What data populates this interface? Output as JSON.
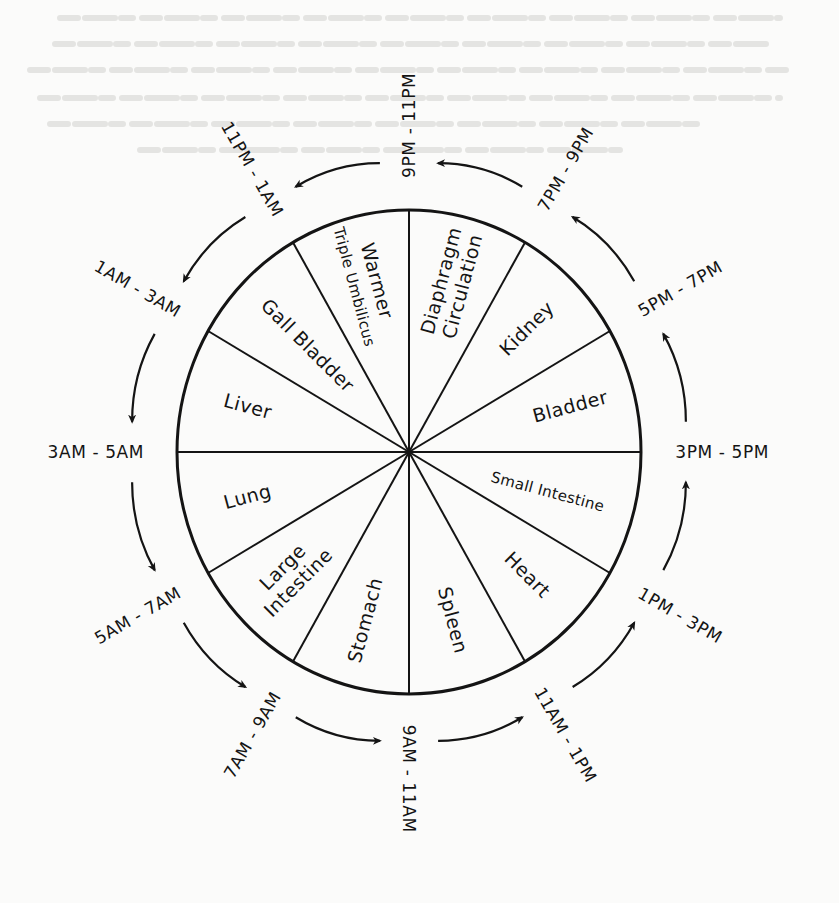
{
  "diagram": {
    "type": "circular-wheel",
    "segments": [
      {
        "organ": "Bladder",
        "lines": [
          "Bladder"
        ],
        "time": "3PM - 5PM",
        "start_deg": 0,
        "end_deg": 30
      },
      {
        "organ": "Kidney",
        "lines": [
          "Kidney"
        ],
        "time": "5PM - 7PM",
        "start_deg": 30,
        "end_deg": 60
      },
      {
        "organ": "Diaphragm Circulation",
        "lines": [
          "Diaphragm",
          "Circulation"
        ],
        "time": "7PM - 9PM",
        "start_deg": 60,
        "end_deg": 90
      },
      {
        "organ": "Triple Warmer Umbilicus",
        "lines": [
          "Warmer",
          "Triple Umbilicus"
        ],
        "time": "9PM - 11PM",
        "start_deg": 90,
        "end_deg": 120
      },
      {
        "organ": "Gall Bladder",
        "lines": [
          "Gall Bladder"
        ],
        "time": "11PM - 1AM",
        "start_deg": 120,
        "end_deg": 150
      },
      {
        "organ": "Liver",
        "lines": [
          "Liver"
        ],
        "time": "1AM - 3AM",
        "start_deg": 150,
        "end_deg": 180
      },
      {
        "organ": "Lung",
        "lines": [
          "Lung"
        ],
        "time": "3AM - 5AM",
        "start_deg": 180,
        "end_deg": 210
      },
      {
        "organ": "Large Intestine",
        "lines": [
          "Large",
          "Intestine"
        ],
        "time": "5AM - 7AM",
        "start_deg": 210,
        "end_deg": 240
      },
      {
        "organ": "Stomach",
        "lines": [
          "Stomach"
        ],
        "time": "7AM - 9AM",
        "start_deg": 240,
        "end_deg": 270
      },
      {
        "organ": "Spleen",
        "lines": [
          "Spleen"
        ],
        "time": "9AM - 11AM",
        "start_deg": 270,
        "end_deg": 300
      },
      {
        "organ": "Heart",
        "lines": [
          "Heart"
        ],
        "time": "11AM - 1PM",
        "start_deg": 300,
        "end_deg": 330
      },
      {
        "organ": "Small Intestine",
        "lines": [
          "Small Intestine"
        ],
        "time": "1PM - 3PM",
        "start_deg": 330,
        "end_deg": 360
      }
    ],
    "time_labels": [
      {
        "text": "9PM - 11PM",
        "spoke_deg": 90
      },
      {
        "text": "11PM - 1AM",
        "spoke_deg": 120
      },
      {
        "text": "1AM - 3AM",
        "spoke_deg": 150
      },
      {
        "text": "3AM - 5AM",
        "spoke_deg": 180
      },
      {
        "text": "5AM - 7AM",
        "spoke_deg": 210
      },
      {
        "text": "7AM - 9AM",
        "spoke_deg": 240
      },
      {
        "text": "9AM - 11AM",
        "spoke_deg": 270
      },
      {
        "text": "11AM - 1PM",
        "spoke_deg": 300
      },
      {
        "text": "1PM - 3PM",
        "spoke_deg": 330
      },
      {
        "text": "3PM - 5PM",
        "spoke_deg": 0
      },
      {
        "text": "5PM - 7PM",
        "spoke_deg": 30
      },
      {
        "text": "7PM - 9PM",
        "spoke_deg": 60
      }
    ],
    "flow_direction": "counterclockwise on page: 9AM-11AM -> 11AM-1PM -> 1PM-3PM -> 3PM-5PM -> 5PM-7PM -> 7PM-9PM -> 9PM-11PM -> 11PM-1AM -> 1AM-3AM -> 3AM-5AM -> 5AM-7AM -> 7AM-9AM",
    "arrow_count": 12,
    "colors": {
      "ink": "#141414",
      "paper": "#fbfbfa",
      "bleed_through": "#e4e4e2"
    }
  }
}
